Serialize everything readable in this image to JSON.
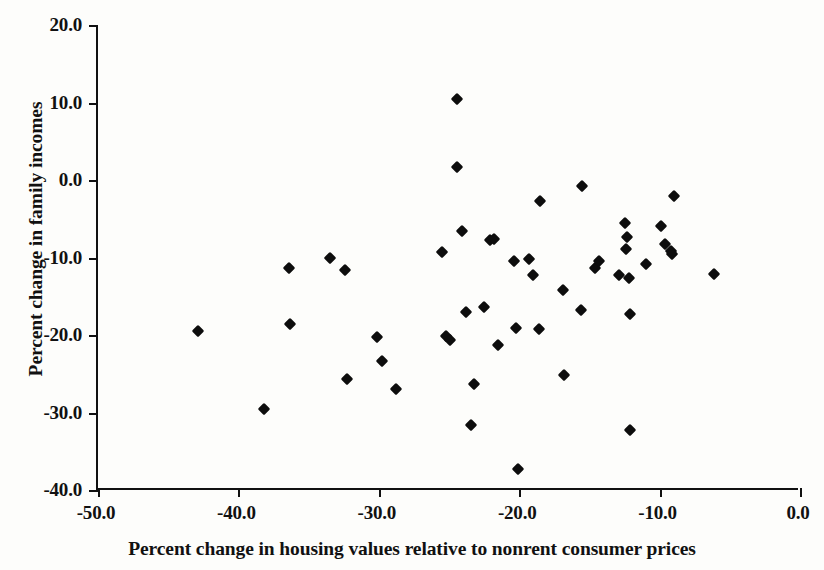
{
  "chart_data": {
    "type": "scatter",
    "title": "",
    "xlabel": "Percent change in housing values relative to nonrent consumer prices",
    "ylabel": "Percent change in family incomes",
    "xlim": [
      -50.0,
      0.0
    ],
    "ylim": [
      -40.0,
      20.0
    ],
    "xticks": [
      "-50.0",
      "-40.0",
      "-30.0",
      "-20.0",
      "-10.0",
      "0.0"
    ],
    "xtick_values": [
      -50.0,
      -40.0,
      -30.0,
      -20.0,
      -10.0,
      0.0
    ],
    "yticks": [
      "20.0",
      "10.0",
      "0.0",
      "-10.0",
      "-20.0",
      "-30.0",
      "-40.0"
    ],
    "ytick_values": [
      20.0,
      10.0,
      0.0,
      -10.0,
      -20.0,
      -30.0,
      -40.0
    ],
    "grid": false,
    "legend": null,
    "marker": "diamond",
    "marker_color": "#0d0d0d",
    "n_points": 54,
    "points": [
      {
        "x": -42.9,
        "y": -19.5
      },
      {
        "x": -38.2,
        "y": -29.5
      },
      {
        "x": -36.4,
        "y": -11.3
      },
      {
        "x": -36.3,
        "y": -18.6
      },
      {
        "x": -33.5,
        "y": -10.0
      },
      {
        "x": -32.4,
        "y": -11.6
      },
      {
        "x": -32.3,
        "y": -25.7
      },
      {
        "x": -30.1,
        "y": -20.3
      },
      {
        "x": -29.8,
        "y": -23.3
      },
      {
        "x": -28.8,
        "y": -27.0
      },
      {
        "x": -25.5,
        "y": -9.3
      },
      {
        "x": -25.2,
        "y": -20.1
      },
      {
        "x": -24.9,
        "y": -20.6
      },
      {
        "x": -24.4,
        "y": 10.4
      },
      {
        "x": -24.4,
        "y": 1.7
      },
      {
        "x": -24.1,
        "y": -6.6
      },
      {
        "x": -23.8,
        "y": -17.0
      },
      {
        "x": -23.4,
        "y": -31.6
      },
      {
        "x": -23.2,
        "y": -26.3
      },
      {
        "x": -22.5,
        "y": -16.4
      },
      {
        "x": -22.1,
        "y": -7.8
      },
      {
        "x": -21.8,
        "y": -7.6
      },
      {
        "x": -21.5,
        "y": -21.3
      },
      {
        "x": -20.4,
        "y": -10.5
      },
      {
        "x": -20.2,
        "y": -19.1
      },
      {
        "x": -20.1,
        "y": -37.3
      },
      {
        "x": -19.3,
        "y": -10.2
      },
      {
        "x": -19.0,
        "y": -12.2
      },
      {
        "x": -18.6,
        "y": -19.2
      },
      {
        "x": -18.5,
        "y": -2.7
      },
      {
        "x": -16.9,
        "y": -14.2
      },
      {
        "x": -16.8,
        "y": -25.2
      },
      {
        "x": -15.6,
        "y": -16.8
      },
      {
        "x": -15.5,
        "y": -0.8
      },
      {
        "x": -14.6,
        "y": -11.3
      },
      {
        "x": -14.3,
        "y": -10.5
      },
      {
        "x": -12.9,
        "y": -12.2
      },
      {
        "x": -12.5,
        "y": -5.6
      },
      {
        "x": -12.4,
        "y": -8.9
      },
      {
        "x": -12.3,
        "y": -7.3
      },
      {
        "x": -12.2,
        "y": -12.6
      },
      {
        "x": -12.1,
        "y": -17.3
      },
      {
        "x": -12.1,
        "y": -32.3
      },
      {
        "x": -11.0,
        "y": -10.9
      },
      {
        "x": -9.9,
        "y": -5.9
      },
      {
        "x": -9.6,
        "y": -8.3
      },
      {
        "x": -9.2,
        "y": -9.1
      },
      {
        "x": -9.1,
        "y": -9.6
      },
      {
        "x": -9.0,
        "y": -2.0
      },
      {
        "x": -6.1,
        "y": -12.1
      }
    ]
  },
  "axes": {
    "x_title": "Percent change in housing values relative to nonrent consumer prices",
    "y_title": "Percent change in family incomes"
  }
}
